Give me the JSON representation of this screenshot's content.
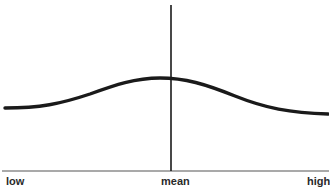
{
  "diagram": {
    "type": "normal-distribution-curve",
    "curve": "flat bell curve",
    "axis_labels": {
      "low": "low",
      "mean": "mean",
      "high": "high"
    },
    "colors": {
      "ink": "#1a1a1a",
      "baseline": "#555555",
      "background": "#ffffff"
    }
  }
}
